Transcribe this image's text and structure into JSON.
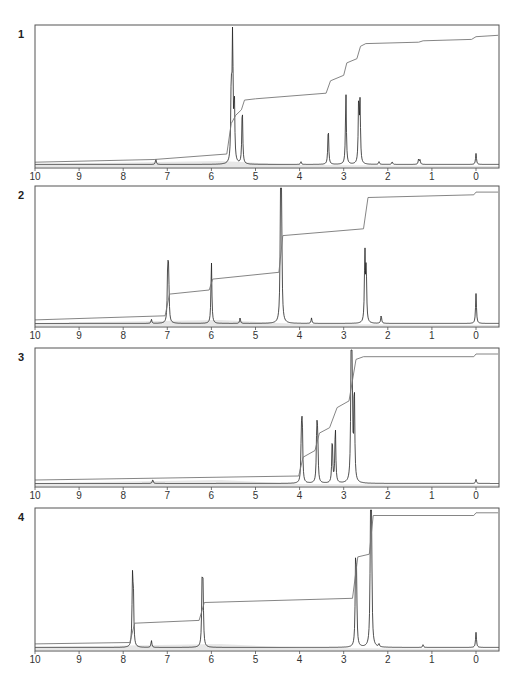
{
  "figure": {
    "width": 523,
    "height": 673,
    "colors": {
      "frame": "#555555",
      "spectrum": "#222222",
      "integral": "#777777",
      "baseline_band": "#bbbbbb",
      "text": "#333333"
    },
    "x_axis_pixels": {
      "ppm_10": 35,
      "ppm_0": 476,
      "right_edge": 499
    }
  },
  "chart_data": [
    {
      "type": "line",
      "panel_label": "1",
      "title": "",
      "xlabel": "",
      "ylabel": "",
      "x_ticks": [
        "10",
        "9",
        "8",
        "7",
        "6",
        "5",
        "4",
        "3",
        "2",
        "1",
        "0"
      ],
      "xlim": [
        10,
        -0.5
      ],
      "grid": false,
      "frame": {
        "top": 25,
        "bottom": 168
      },
      "tick_label_y": 180,
      "series": [
        {
          "name": "1H NMR spectrum (peaks: ppm, relative height)",
          "peaks": [
            [
              7.26,
              0.04
            ],
            [
              5.55,
              0.55
            ],
            [
              5.52,
              1.0
            ],
            [
              5.48,
              0.45
            ],
            [
              5.3,
              0.42
            ],
            [
              3.97,
              0.02
            ],
            [
              3.35,
              0.27
            ],
            [
              2.95,
              0.52
            ],
            [
              2.66,
              0.47
            ],
            [
              2.63,
              0.42
            ],
            [
              2.2,
              0.02
            ],
            [
              1.9,
              0.02
            ],
            [
              1.3,
              0.04
            ],
            [
              1.27,
              0.03
            ],
            [
              0.0,
              0.08
            ]
          ]
        },
        {
          "name": "integral trace",
          "points": [
            [
              10,
              0.02
            ],
            [
              7.3,
              0.04
            ],
            [
              5.65,
              0.08
            ],
            [
              5.55,
              0.3
            ],
            [
              5.45,
              0.36
            ],
            [
              5.32,
              0.4
            ],
            [
              5.25,
              0.47
            ],
            [
              5.0,
              0.48
            ],
            [
              3.4,
              0.52
            ],
            [
              3.3,
              0.61
            ],
            [
              3.0,
              0.65
            ],
            [
              2.93,
              0.74
            ],
            [
              2.7,
              0.77
            ],
            [
              2.62,
              0.86
            ],
            [
              2.5,
              0.88
            ],
            [
              1.3,
              0.89
            ],
            [
              1.2,
              0.9
            ],
            [
              0.1,
              0.91
            ],
            [
              0.0,
              0.93
            ],
            [
              -0.5,
              0.94
            ]
          ]
        }
      ]
    },
    {
      "type": "line",
      "panel_label": "2",
      "title": "",
      "xlabel": "",
      "ylabel": "",
      "x_ticks": [
        "10",
        "9",
        "8",
        "7",
        "6",
        "5",
        "4",
        "3",
        "2",
        "1",
        "0"
      ],
      "xlim": [
        10,
        -0.5
      ],
      "grid": false,
      "frame": {
        "top": 186,
        "bottom": 327
      },
      "tick_label_y": 339,
      "series": [
        {
          "name": "1H NMR spectrum (peaks: ppm, relative height)",
          "peaks": [
            [
              7.36,
              0.03
            ],
            [
              6.99,
              0.4
            ],
            [
              6.97,
              0.34
            ],
            [
              6.0,
              0.46
            ],
            [
              5.35,
              0.04
            ],
            [
              4.43,
              1.0
            ],
            [
              4.41,
              0.8
            ],
            [
              3.73,
              0.04
            ],
            [
              2.52,
              0.52
            ],
            [
              2.49,
              0.4
            ],
            [
              2.15,
              0.06
            ],
            [
              0.0,
              0.22
            ]
          ]
        },
        {
          "name": "integral trace",
          "points": [
            [
              10,
              0.03
            ],
            [
              7.05,
              0.06
            ],
            [
              6.95,
              0.22
            ],
            [
              6.05,
              0.25
            ],
            [
              5.97,
              0.33
            ],
            [
              4.47,
              0.38
            ],
            [
              4.38,
              0.65
            ],
            [
              2.55,
              0.7
            ],
            [
              2.45,
              0.93
            ],
            [
              0.05,
              0.95
            ],
            [
              0.0,
              0.97
            ],
            [
              -0.5,
              0.97
            ]
          ]
        }
      ]
    },
    {
      "type": "line",
      "panel_label": "3",
      "title": "",
      "xlabel": "",
      "ylabel": "",
      "x_ticks": [
        "10",
        "9",
        "8",
        "7",
        "6",
        "5",
        "4",
        "3",
        "2",
        "1",
        "0"
      ],
      "xlim": [
        10,
        -0.5
      ],
      "grid": false,
      "frame": {
        "top": 348,
        "bottom": 487
      },
      "tick_label_y": 499,
      "series": [
        {
          "name": "1H NMR spectrum (peaks: ppm, relative height)",
          "peaks": [
            [
              7.33,
              0.03
            ],
            [
              3.96,
              0.34
            ],
            [
              3.94,
              0.44
            ],
            [
              3.61,
              0.4
            ],
            [
              3.59,
              0.32
            ],
            [
              3.26,
              0.34
            ],
            [
              3.19,
              0.43
            ],
            [
              2.83,
              1.0
            ],
            [
              2.81,
              0.8
            ],
            [
              2.76,
              0.72
            ],
            [
              0.0,
              0.03
            ]
          ]
        },
        {
          "name": "integral trace",
          "points": [
            [
              10,
              0.03
            ],
            [
              4.02,
              0.06
            ],
            [
              3.92,
              0.2
            ],
            [
              3.65,
              0.25
            ],
            [
              3.55,
              0.38
            ],
            [
              3.32,
              0.42
            ],
            [
              3.15,
              0.57
            ],
            [
              2.88,
              0.62
            ],
            [
              2.72,
              0.93
            ],
            [
              2.55,
              0.95
            ],
            [
              0.05,
              0.95
            ],
            [
              0.0,
              0.97
            ],
            [
              -0.5,
              0.97
            ]
          ]
        }
      ]
    },
    {
      "type": "line",
      "panel_label": "4",
      "title": "",
      "xlabel": "",
      "ylabel": "",
      "x_ticks": [
        "10",
        "9",
        "8",
        "7",
        "6",
        "5",
        "4",
        "3",
        "2",
        "1",
        "0"
      ],
      "xlim": [
        10,
        -0.5
      ],
      "grid": false,
      "frame": {
        "top": 508,
        "bottom": 651
      },
      "tick_label_y": 663,
      "series": [
        {
          "name": "1H NMR spectrum (peaks: ppm, relative height)",
          "peaks": [
            [
              7.79,
              0.46
            ],
            [
              7.77,
              0.36
            ],
            [
              7.36,
              0.05
            ],
            [
              6.21,
              0.46
            ],
            [
              6.19,
              0.38
            ],
            [
              2.73,
              0.57
            ],
            [
              2.71,
              0.45
            ],
            [
              2.39,
              1.0
            ],
            [
              2.37,
              0.85
            ],
            [
              2.2,
              0.02
            ],
            [
              1.2,
              0.02
            ],
            [
              0.0,
              0.11
            ]
          ]
        },
        {
          "name": "integral trace",
          "points": [
            [
              10,
              0.03
            ],
            [
              7.85,
              0.04
            ],
            [
              7.74,
              0.18
            ],
            [
              6.28,
              0.2
            ],
            [
              6.16,
              0.33
            ],
            [
              2.8,
              0.36
            ],
            [
              2.68,
              0.66
            ],
            [
              2.42,
              0.68
            ],
            [
              2.33,
              0.96
            ],
            [
              0.05,
              0.96
            ],
            [
              0.0,
              0.98
            ],
            [
              -0.5,
              0.98
            ]
          ]
        }
      ]
    }
  ]
}
